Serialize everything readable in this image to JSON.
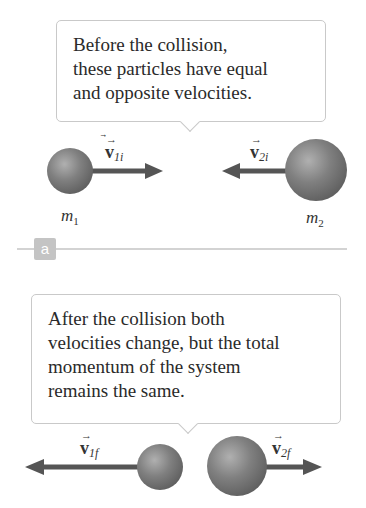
{
  "panel_a": {
    "callout_lines": [
      "Before the collision,",
      "these particles have equal",
      "and opposite velocities."
    ],
    "particle1": {
      "mass_label": "m",
      "mass_sub": "1",
      "velocity_symbol": "v",
      "velocity_sub": "1i",
      "direction": "right"
    },
    "particle2": {
      "mass_label": "m",
      "mass_sub": "2",
      "velocity_symbol": "v",
      "velocity_sub": "2i",
      "direction": "left"
    },
    "tag": "a"
  },
  "panel_b": {
    "callout_lines": [
      "After the collision both",
      "velocities change, but the total",
      "momentum of the system",
      "remains the same."
    ],
    "particle1": {
      "velocity_symbol": "v",
      "velocity_sub": "1f",
      "direction": "left"
    },
    "particle2": {
      "velocity_symbol": "v",
      "velocity_sub": "2f",
      "direction": "right"
    }
  },
  "colors": {
    "sphere": "#7a7a7a",
    "arrow": "#555555",
    "callout_border": "#c9c9c9",
    "tag_bg": "#c4c4c4",
    "divider": "#d3d3d3"
  }
}
